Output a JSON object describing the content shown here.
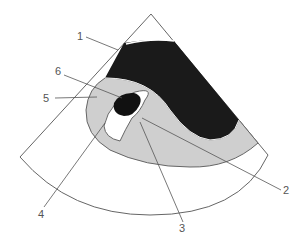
{
  "diagram": {
    "type": "ultrasound-sector-schematic",
    "labels": [
      {
        "id": "1",
        "text": "1"
      },
      {
        "id": "2",
        "text": "2"
      },
      {
        "id": "3",
        "text": "3"
      },
      {
        "id": "4",
        "text": "4"
      },
      {
        "id": "5",
        "text": "5"
      },
      {
        "id": "6",
        "text": "6"
      }
    ],
    "colors": {
      "background": "#ffffff",
      "outline": "#666666",
      "dark_region": "#1a1a1a",
      "gray_region": "#cfcfcf",
      "white_region": "#ffffff",
      "leader": "#555555"
    }
  }
}
